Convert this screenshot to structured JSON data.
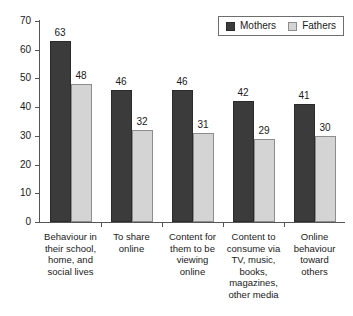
{
  "chart_data": {
    "type": "bar",
    "title": "",
    "subtitle": "",
    "xlabel": "",
    "ylabel": "",
    "ylim": [
      0,
      70
    ],
    "yticks": [
      0,
      10,
      20,
      30,
      40,
      50,
      60,
      70
    ],
    "grid": false,
    "legend_position": "top-right",
    "categories": [
      "Behaviour in their school, home, and social lives",
      "To share online",
      "Content for them to be viewing online",
      "Content to consume via TV, music, books, magazines, other media",
      "Online behaviour toward others"
    ],
    "category_lines": [
      [
        "Behaviour in",
        "their school,",
        "home, and",
        "social lives"
      ],
      [
        "To share",
        "online"
      ],
      [
        "Content for",
        "them to be",
        "viewing",
        "online"
      ],
      [
        "Content to",
        "consume via",
        "TV, music,",
        "books,",
        "magazines,",
        "other media"
      ],
      [
        "Online",
        "behaviour",
        "toward",
        "others"
      ]
    ],
    "series": [
      {
        "name": "Mothers",
        "color": "#3b3b3b",
        "values": [
          63,
          46,
          46,
          42,
          41
        ]
      },
      {
        "name": "Fathers",
        "color": "#d4d4d4",
        "values": [
          48,
          32,
          31,
          29,
          30
        ]
      }
    ]
  },
  "legend": {
    "items": [
      {
        "label": "Mothers",
        "swatch": "mothers-swatch"
      },
      {
        "label": "Fathers",
        "swatch": "fathers-swatch"
      }
    ]
  },
  "axis": {
    "y_tick_labels": [
      "70",
      "60",
      "50",
      "40",
      "30",
      "20",
      "10",
      "0"
    ]
  }
}
